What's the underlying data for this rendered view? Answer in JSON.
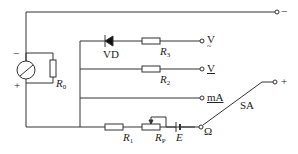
{
  "diagram": {
    "components": {
      "meter_minus": "−",
      "meter_plus": "+",
      "shunt_resistor": {
        "symbol": "R",
        "subscript": "0"
      },
      "diode": "VD",
      "r3": {
        "symbol": "R",
        "subscript": "3"
      },
      "r2": {
        "symbol": "R",
        "subscript": "2"
      },
      "r1": {
        "symbol": "R",
        "subscript": "1"
      },
      "rp": {
        "symbol": "R",
        "subscript": "P"
      },
      "battery": "E",
      "switch": "SA"
    },
    "terminals": {
      "common_minus": "−",
      "ac_voltage": "V~",
      "ac_voltage_label": "V",
      "dc_voltage": "V",
      "current": "mA",
      "ohm": "Ω",
      "output_plus": "+"
    },
    "colors": {
      "line": "#333333",
      "background": "#ffffff"
    }
  }
}
